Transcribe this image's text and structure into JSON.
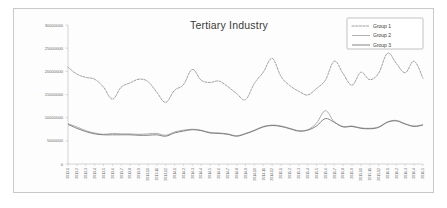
{
  "chart_data": {
    "type": "line",
    "title": "Tertiary Industry",
    "xlabel": "",
    "ylabel": "",
    "ylim": [
      0,
      30000000
    ],
    "ytick_labels": [
      "30000000",
      "25000000",
      "20000000",
      "15000000",
      "10000000",
      "5000000",
      "0"
    ],
    "ytick_values": [
      30000000,
      25000000,
      20000000,
      15000000,
      10000000,
      5000000,
      0
    ],
    "grid": false,
    "legend_position": "top-right",
    "categories": [
      "2013.1",
      "2013.2",
      "2013.3",
      "2013.4",
      "2013.5",
      "2013.6",
      "2013.7",
      "2013.8",
      "2013.9",
      "2013.10",
      "2013.11",
      "2013.12",
      "2014.1",
      "2014.2",
      "2014.3",
      "2014.4",
      "2014.5",
      "2014.6",
      "2014.7",
      "2014.8",
      "2014.9",
      "2014.10",
      "2014.11",
      "2014.12",
      "2015.1",
      "2015.2",
      "2015.3",
      "2015.4",
      "2015.5",
      "2015.6",
      "2015.7",
      "2015.8",
      "2015.9",
      "2015.10",
      "2015.11",
      "2015.12",
      "2016.1",
      "2016.2",
      "2016.3",
      "2016.4",
      "2016.5"
    ],
    "series": [
      {
        "name": "Group 1",
        "style": "dashed",
        "color": "#8e8e8e",
        "values": [
          20900000,
          19400000,
          18700000,
          18300000,
          16600000,
          14000000,
          16600000,
          17500000,
          18300000,
          17800000,
          15500000,
          13300000,
          15900000,
          17100000,
          20400000,
          18100000,
          17600000,
          17900000,
          16700000,
          15200000,
          13900000,
          17400000,
          19800000,
          22800000,
          18900000,
          16900000,
          15700000,
          14900000,
          16300000,
          18100000,
          22200000,
          19500000,
          17000000,
          19800000,
          18200000,
          19600000,
          23900000,
          21700000,
          19700000,
          22200000,
          18500000
        ]
      },
      {
        "name": "Group 2",
        "style": "solid",
        "color": "#9a9a9a",
        "values": [
          8700000,
          8000000,
          7200000,
          6700000,
          6400000,
          6600000,
          6500000,
          6500000,
          6400000,
          6500000,
          6600000,
          6200000,
          6900000,
          7300000,
          7500000,
          7300000,
          6800000,
          6700000,
          6500000,
          6100000,
          6600000,
          7300000,
          8100000,
          8400000,
          8200000,
          7700000,
          7200000,
          7400000,
          8800000,
          11500000,
          9100000,
          8100000,
          8200000,
          7800000,
          7700000,
          8000000,
          9100000,
          9400000,
          8700000,
          8200000,
          8500000
        ]
      },
      {
        "name": "Group 3",
        "style": "solid",
        "color": "#6f6f6f",
        "values": [
          8550000,
          7700000,
          7000000,
          6500000,
          6300000,
          6300000,
          6300000,
          6300000,
          6200000,
          6200000,
          6300000,
          6000000,
          6700000,
          7100000,
          7400000,
          7200000,
          6700000,
          6600000,
          6400000,
          6000000,
          6500000,
          7200000,
          8000000,
          8300000,
          8100000,
          7600000,
          7100000,
          7300000,
          8200000,
          9800000,
          9000000,
          8000000,
          8100000,
          7700000,
          7600000,
          7900000,
          9000000,
          9300000,
          8600000,
          8100000,
          8400000
        ]
      }
    ]
  },
  "legend": {
    "items": [
      {
        "label": "Group 1"
      },
      {
        "label": "Group 2"
      },
      {
        "label": "Group 3"
      }
    ]
  }
}
